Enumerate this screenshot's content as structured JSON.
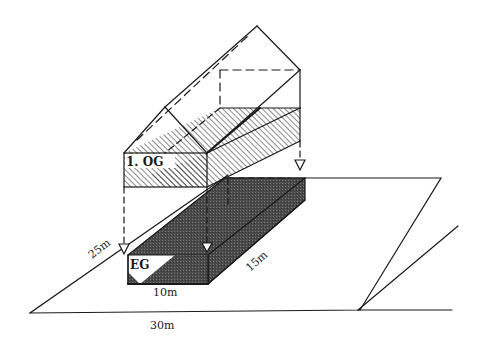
{
  "diagram": {
    "type": "isometric-building-on-plot",
    "floors": [
      {
        "label": "1. OG",
        "fill": "hatched"
      },
      {
        "label": "EG",
        "fill": "dark-stipple"
      }
    ],
    "dimensions": {
      "plot_width": "30m",
      "plot_depth": "25m",
      "building_width": "10m",
      "building_depth": "15m"
    },
    "colors": {
      "line": "#1a1a1a",
      "shade": "#4a4a4a",
      "background": "#ffffff"
    }
  }
}
